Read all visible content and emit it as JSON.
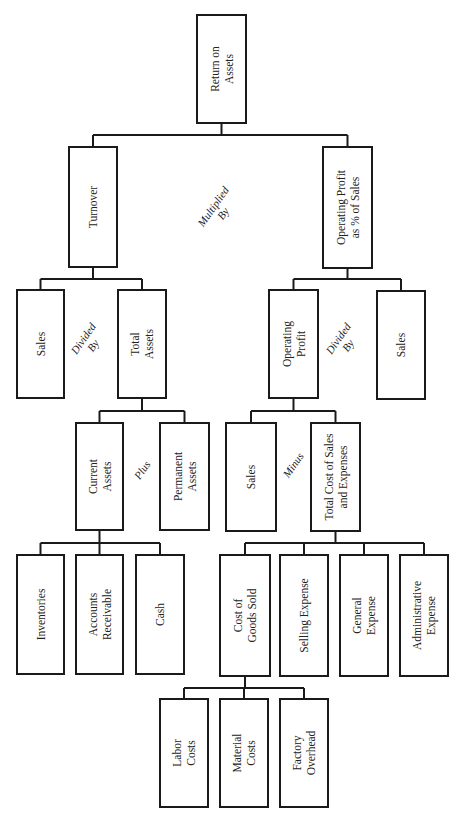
{
  "nodes": {
    "roa": [
      "Return on",
      "Assets"
    ],
    "turnover": [
      "Turnover"
    ],
    "op_profit_pct": [
      "Operating Profit",
      "as % of Sales"
    ],
    "sales_1": [
      "Sales"
    ],
    "total_assets": [
      "Total",
      "Assets"
    ],
    "operating_profit": [
      "Operating",
      "Profit"
    ],
    "sales_2": [
      "Sales"
    ],
    "current_assets": [
      "Current",
      "Assets"
    ],
    "permanent_assets": [
      "Permanent",
      "Assets"
    ],
    "sales_3": [
      "Sales"
    ],
    "total_cost": [
      "Total Cost of Sales",
      "and Expenses"
    ],
    "inventories": [
      "Inventories"
    ],
    "accounts_receivable": [
      "Accounts",
      "Receivable"
    ],
    "cash": [
      "Cash"
    ],
    "cogs": [
      "Cost of",
      "Goods Sold"
    ],
    "selling_expense": [
      "Selling Expense"
    ],
    "general_expense": [
      "General",
      "Expense"
    ],
    "administrative_expense": [
      "Administrative",
      "Expense"
    ],
    "labor_costs": [
      "Labor",
      "Costs"
    ],
    "material_costs": [
      "Material",
      "Costs"
    ],
    "factory_overhead": [
      "Factory",
      "Overhead"
    ]
  },
  "operators": {
    "multiplied_by": [
      "Multiplied",
      "By"
    ],
    "divided_by_left": [
      "Divided",
      "By"
    ],
    "divided_by_right": [
      "Divided",
      "By"
    ],
    "plus": [
      "Plus"
    ],
    "minus": [
      "Minus"
    ]
  },
  "edges": [
    [
      "roa",
      "turnover"
    ],
    [
      "roa",
      "op_profit_pct"
    ],
    [
      "turnover",
      "sales_1"
    ],
    [
      "turnover",
      "total_assets"
    ],
    [
      "op_profit_pct",
      "operating_profit"
    ],
    [
      "op_profit_pct",
      "sales_2"
    ],
    [
      "total_assets",
      "current_assets"
    ],
    [
      "total_assets",
      "permanent_assets"
    ],
    [
      "operating_profit",
      "sales_3"
    ],
    [
      "operating_profit",
      "total_cost"
    ],
    [
      "current_assets",
      "inventories"
    ],
    [
      "current_assets",
      "accounts_receivable"
    ],
    [
      "current_assets",
      "cash"
    ],
    [
      "total_cost",
      "cogs"
    ],
    [
      "total_cost",
      "selling_expense"
    ],
    [
      "total_cost",
      "general_expense"
    ],
    [
      "total_cost",
      "administrative_expense"
    ],
    [
      "cogs",
      "labor_costs"
    ],
    [
      "cogs",
      "material_costs"
    ],
    [
      "cogs",
      "factory_overhead"
    ]
  ]
}
